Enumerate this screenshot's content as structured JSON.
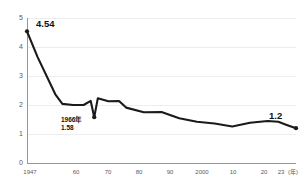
{
  "chart_data": {
    "type": "line",
    "title": "",
    "xlabel": "年",
    "ylabel": "",
    "xlim": [
      1947,
      2023
    ],
    "ylim": [
      0,
      5
    ],
    "grid": true,
    "legend": "none",
    "x_tick_labels": [
      "1947",
      "60",
      "70",
      "80",
      "90",
      "2000",
      "10",
      "20",
      "23"
    ],
    "x_tick_values": [
      1947,
      1960,
      1970,
      1980,
      1990,
      2000,
      2010,
      2020,
      2023
    ],
    "x_unit_label": "(年)",
    "y_tick_labels": [
      "0",
      "1",
      "2",
      "3",
      "4",
      "5"
    ],
    "y_tick_values": [
      0,
      1,
      2,
      3,
      4,
      5
    ],
    "series": [
      {
        "name": "合計特殊出生率",
        "color": "#1a1a1a",
        "x": [
          1947,
          1950,
          1955,
          1957,
          1960,
          1963,
          1965,
          1966,
          1967,
          1970,
          1973,
          1975,
          1980,
          1985,
          1990,
          1995,
          2000,
          2005,
          2010,
          2015,
          2018,
          2020,
          2023
        ],
        "values": [
          4.54,
          3.65,
          2.37,
          2.04,
          2.0,
          2.0,
          2.14,
          1.58,
          2.23,
          2.13,
          2.14,
          1.91,
          1.75,
          1.76,
          1.54,
          1.42,
          1.36,
          1.26,
          1.39,
          1.45,
          1.42,
          1.33,
          1.2
        ]
      }
    ],
    "annotations": [
      {
        "name": "start-value",
        "text": "4.54",
        "x": 1947,
        "y": 4.54,
        "marker": true
      },
      {
        "name": "hinoeuma-year",
        "text": "1966年",
        "x": 1966,
        "y": 1.58,
        "marker": true
      },
      {
        "name": "hinoeuma-value",
        "text": "1.58",
        "x": 1966,
        "y": 1.58,
        "marker": false
      },
      {
        "name": "end-value",
        "text": "1.2",
        "x": 2023,
        "y": 1.2,
        "marker": true
      }
    ]
  },
  "labels": {
    "y0": "0",
    "y1": "1",
    "y2": "2",
    "y3": "3",
    "y4": "4",
    "y5": "5",
    "x1947": "1947",
    "x1960": "60",
    "x1970": "70",
    "x1980": "80",
    "x1990": "90",
    "x2000": "2000",
    "x2010": "10",
    "x2020": "20",
    "x2023": "23",
    "xunit": "(年)",
    "ann_start": "4.54",
    "ann_year": "1966年",
    "ann_dip": "1.58",
    "ann_end": "1.2"
  },
  "colors": {
    "line": "#1a1a1a",
    "grid": "#e9e9e9",
    "axis": "#8c8c8c",
    "tick_text": "#5a5a5a",
    "annotation_text": "#111111",
    "background": "#ffffff"
  }
}
